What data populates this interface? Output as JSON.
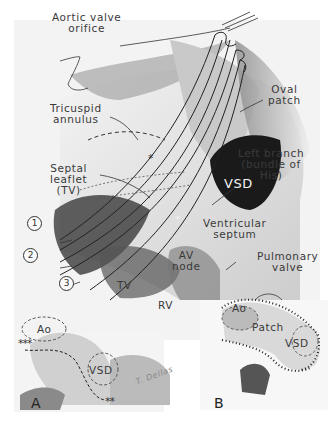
{
  "figure": {
    "main_labels": {
      "aortic_valve_orifice": "Aortic valve\norifice",
      "tricuspid_annulus": "Tricuspid\nannulus",
      "septal_leaflet": "Septal\nleaflet\n(TV)",
      "oval_patch": "Oval\npatch",
      "left_branch": "Left branch\n(bundle of\nHis)",
      "vsd": "VSD",
      "ventricular_septum": "Ventricular\nseptum",
      "av_node": "AV\nnode",
      "tv": "TV",
      "rv": "RV"
    },
    "markers": {
      "circle_1": "1",
      "circle_2": "2",
      "circle_3": "3",
      "asterisk_single_top": "*",
      "asterisk_single_mid": "*",
      "asterisk_triple": "***",
      "asterisk_double": "**"
    },
    "inset_a": {
      "panel_label": "A",
      "ao": "Ao",
      "vsd": "VSD",
      "signature": "T. Dellas"
    },
    "inset_b": {
      "panel_label": "B",
      "pulmonary_valve": "Pulmonary\nvalve",
      "ao": "Ao",
      "patch": "Patch",
      "vsd": "VSD"
    },
    "colors": {
      "background": "#ffffff",
      "ink": "#2a2a2a",
      "tissue_light": "#e6e6e6",
      "tissue_mid": "#a8a8a8",
      "tissue_dark": "#2b2b2b"
    }
  }
}
